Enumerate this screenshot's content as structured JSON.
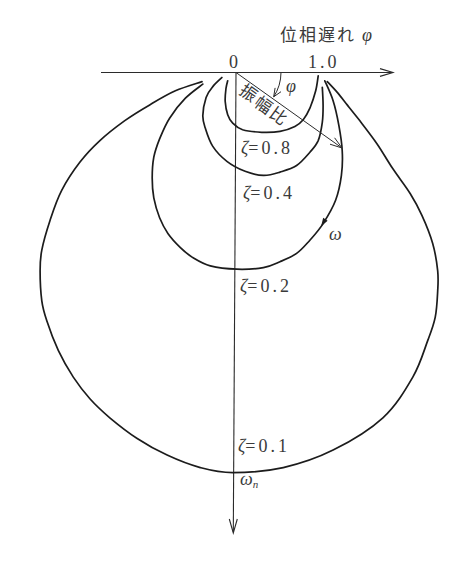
{
  "figure": {
    "phase_lag_label": "位相遅れ",
    "phase_lag_symbol": "φ",
    "origin_tick": "0",
    "unit_tick": "1.0",
    "amplitude_ratio_label": "振幅比",
    "phase_angle_symbol": "φ",
    "omega_symbol": "ω",
    "omega_n_symbol": "ω",
    "omega_n_subscript": "n"
  },
  "chart_data": {
    "type": "line",
    "subtype": "vector locus (Nyquist-style, phase lag measured clockwise)",
    "title": "",
    "xlabel": "位相遅れ φ",
    "ylabel": "",
    "x_ticks": [
      "0",
      "1.0"
    ],
    "x_range": [
      -1.63,
      1.89
    ],
    "y_range_downward": [
      0,
      5.55
    ],
    "grid": false,
    "legend": "none (curves labelled inline)",
    "annotations": [
      "振幅比 (amplitude ratio vector)",
      "φ (phase angle arc)",
      "ω (direction of increasing frequency)",
      "ωn (natural frequency point on ζ=0.1 curve)"
    ],
    "series": [
      {
        "name": "ζ=0.8",
        "zeta": 0.8,
        "label": {
          "symbol": "ζ",
          "text": "=0.8"
        },
        "points": [
          [
            0.99,
            0.04
          ],
          [
            0.96,
            0.22
          ],
          [
            0.89,
            0.43
          ],
          [
            0.81,
            0.57
          ],
          [
            0.71,
            0.65
          ],
          [
            0.53,
            0.71
          ],
          [
            0.31,
            0.72
          ],
          [
            0.08,
            0.69
          ],
          [
            -0.04,
            0.61
          ],
          [
            -0.1,
            0.51
          ],
          [
            -0.13,
            0.35
          ],
          [
            -0.12,
            0.19
          ],
          [
            -0.1,
            0.1
          ]
        ]
      },
      {
        "name": "ζ=0.4",
        "zeta": 0.4,
        "label": {
          "symbol": "ζ",
          "text": "=0.4"
        },
        "points": [
          [
            1.04,
            0.18
          ],
          [
            1.05,
            0.4
          ],
          [
            1.04,
            0.6
          ],
          [
            0.99,
            0.82
          ],
          [
            0.89,
            0.96
          ],
          [
            0.73,
            1.12
          ],
          [
            0.53,
            1.2
          ],
          [
            0.33,
            1.24
          ],
          [
            0.11,
            1.19
          ],
          [
            -0.11,
            1.07
          ],
          [
            -0.28,
            0.89
          ],
          [
            -0.37,
            0.67
          ],
          [
            -0.4,
            0.52
          ],
          [
            -0.36,
            0.3
          ],
          [
            -0.28,
            0.17
          ],
          [
            -0.17,
            0.06
          ]
        ]
      },
      {
        "name": "ζ=0.2",
        "zeta": 0.2,
        "label": {
          "symbol": "ζ",
          "text": "=0.2"
        },
        "points": [
          [
            1.07,
            0.1
          ],
          [
            1.17,
            0.34
          ],
          [
            1.24,
            0.64
          ],
          [
            1.28,
            0.94
          ],
          [
            1.27,
            1.24
          ],
          [
            1.2,
            1.54
          ],
          [
            1.05,
            1.82
          ],
          [
            0.89,
            2.02
          ],
          [
            0.73,
            2.18
          ],
          [
            0.53,
            2.28
          ],
          [
            0.33,
            2.35
          ],
          [
            0.01,
            2.37
          ],
          [
            -0.31,
            2.33
          ],
          [
            -0.52,
            2.23
          ],
          [
            -0.67,
            2.11
          ],
          [
            -0.82,
            1.94
          ],
          [
            -0.92,
            1.75
          ],
          [
            -0.99,
            1.51
          ],
          [
            -1.01,
            1.27
          ],
          [
            -0.99,
            1.02
          ],
          [
            -0.92,
            0.8
          ],
          [
            -0.8,
            0.55
          ],
          [
            -0.61,
            0.31
          ],
          [
            -0.4,
            0.14
          ]
        ]
      },
      {
        "name": "ζ=0.1",
        "zeta": 0.1,
        "label": {
          "symbol": "ζ",
          "text": "=0.1"
        },
        "points": [
          [
            1.1,
            0.11
          ],
          [
            1.22,
            0.24
          ],
          [
            1.34,
            0.39
          ],
          [
            1.49,
            0.58
          ],
          [
            1.7,
            0.86
          ],
          [
            1.89,
            1.16
          ],
          [
            2.1,
            1.46
          ],
          [
            2.24,
            1.72
          ],
          [
            2.37,
            2.06
          ],
          [
            2.43,
            2.39
          ],
          [
            2.43,
            2.63
          ],
          [
            2.4,
            2.95
          ],
          [
            2.31,
            3.23
          ],
          [
            2.13,
            3.67
          ],
          [
            1.77,
            4.16
          ],
          [
            1.17,
            4.55
          ],
          [
            0.57,
            4.76
          ],
          [
            -0.04,
            4.82
          ],
          [
            -0.43,
            4.76
          ],
          [
            -0.83,
            4.61
          ],
          [
            -1.19,
            4.41
          ],
          [
            -1.52,
            4.16
          ],
          [
            -1.76,
            3.93
          ],
          [
            -1.96,
            3.67
          ],
          [
            -2.14,
            3.35
          ],
          [
            -2.28,
            2.99
          ],
          [
            -2.34,
            2.75
          ],
          [
            -2.36,
            2.39
          ],
          [
            -2.34,
            2.14
          ],
          [
            -2.24,
            1.78
          ],
          [
            -2.1,
            1.42
          ],
          [
            -1.88,
            1.08
          ],
          [
            -1.64,
            0.82
          ],
          [
            -1.34,
            0.58
          ],
          [
            -1.04,
            0.39
          ],
          [
            -0.73,
            0.22
          ],
          [
            -0.41,
            0.11
          ]
        ]
      }
    ]
  }
}
